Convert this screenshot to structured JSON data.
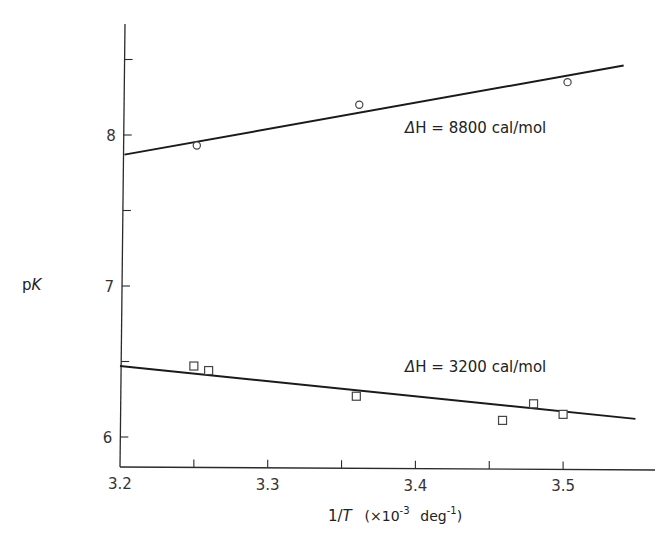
{
  "chart_data": {
    "type": "scatter",
    "title": "",
    "xlabel": "1/T (×10⁻³ deg⁻¹)",
    "xlabel_parts": {
      "main": "1/",
      "italic": "T",
      "unit_open": "(×10",
      "exp1": "-3",
      "unit_mid": "deg",
      "exp2": "-1",
      "unit_close": ")"
    },
    "ylabel": "pK",
    "ylabel_parts": {
      "p": "p",
      "k": "K"
    },
    "xlim": [
      3.2,
      3.56
    ],
    "ylim": [
      5.8,
      8.73
    ],
    "xticks": [
      3.2,
      3.25,
      3.3,
      3.35,
      3.4,
      3.45,
      3.5
    ],
    "xtick_labels": [
      "3.2",
      "",
      "3.3",
      "",
      "3.4",
      "",
      "3.5"
    ],
    "yticks": [
      6.0,
      6.5,
      7.0,
      7.5,
      8.0,
      8.5
    ],
    "ytick_labels": [
      "6",
      "",
      "7",
      "",
      "8",
      ""
    ],
    "grid": false,
    "legend": null,
    "series": [
      {
        "name": "ΔH = 8800 cal/mol",
        "marker": "circle",
        "points": [
          {
            "x": 3.252,
            "y": 7.93
          },
          {
            "x": 3.362,
            "y": 8.2
          },
          {
            "x": 3.503,
            "y": 8.35
          }
        ],
        "fit_line": {
          "x1": 3.203,
          "y1": 7.87,
          "x2": 3.541,
          "y2": 8.46
        }
      },
      {
        "name": "ΔH = 3200 cal/mol",
        "marker": "square",
        "points": [
          {
            "x": 3.25,
            "y": 6.47
          },
          {
            "x": 3.26,
            "y": 6.44
          },
          {
            "x": 3.36,
            "y": 6.27
          },
          {
            "x": 3.459,
            "y": 6.11
          },
          {
            "x": 3.48,
            "y": 6.22
          },
          {
            "x": 3.5,
            "y": 6.15
          }
        ],
        "fit_line": {
          "x1": 3.2,
          "y1": 6.47,
          "x2": 3.549,
          "y2": 6.12
        }
      }
    ],
    "annotations": [
      {
        "text": "ΔH = 8800 cal/mol",
        "prefix": "Δ",
        "body": "H = 8800  cal/mol",
        "x": 3.393,
        "y": 8.05
      },
      {
        "text": "ΔH = 3200 cal/mol",
        "prefix": "Δ",
        "body": "H = 3200  cal/mol",
        "x": 3.393,
        "y": 6.47
      }
    ]
  }
}
